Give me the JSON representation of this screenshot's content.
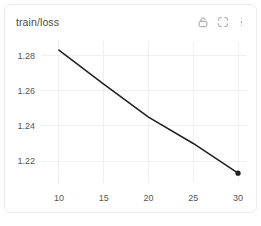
{
  "panel": {
    "title": "train/loss",
    "actions": [
      {
        "name": "lock-icon",
        "label": "Lock"
      },
      {
        "name": "expand-icon",
        "label": "Expand"
      },
      {
        "name": "more-options-icon",
        "label": "More"
      }
    ]
  },
  "colors": {
    "line": "#1f1f1f",
    "grid": "#f0f0f0",
    "tick_text": "#555555",
    "title_text": "#4a4a4a",
    "icon": "#9a9a9a",
    "panel_border": "#ececec",
    "background": "#ffffff"
  },
  "chart_data": {
    "type": "line",
    "title": "train/loss",
    "xlabel": "",
    "ylabel": "",
    "xlim": [
      8.0,
      31.0
    ],
    "ylim": [
      1.2075,
      1.2895
    ],
    "xticks": [
      10,
      15,
      20,
      25,
      30
    ],
    "xtick_labels": [
      "10",
      "15",
      "20",
      "25",
      "30"
    ],
    "yticks": [
      1.28,
      1.26,
      1.24,
      1.22
    ],
    "ytick_labels": [
      "1.28",
      "1.26",
      "1.24",
      "1.22"
    ],
    "grid": true,
    "grid_axes": "both",
    "legend": false,
    "markers": "last-point-only",
    "series": [
      {
        "name": "train/loss",
        "color": "#1f1f1f",
        "x": [
          10,
          15,
          20,
          25,
          30
        ],
        "values": [
          1.2832,
          1.2638,
          1.245,
          1.23,
          1.2131
        ]
      }
    ]
  }
}
